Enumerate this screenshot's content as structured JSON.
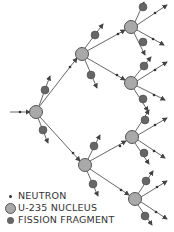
{
  "legend": {
    "neutron": "NEUTRON",
    "nucleus": "U-235 NUCLEUS",
    "fragment": "FISSION FRAGMENT"
  },
  "colors": {
    "nucleus_fill": "#a9a9a9",
    "nucleus_stroke": "#555555",
    "fragment_fill": "#666666",
    "line": "#555555",
    "text": "#333333"
  },
  "nuclei": [
    {
      "id": "gen1",
      "x": 36,
      "y": 112
    },
    {
      "id": "gen2-upper",
      "x": 82,
      "y": 54
    },
    {
      "id": "gen2-lower",
      "x": 85,
      "y": 165
    },
    {
      "id": "gen3-a",
      "x": 131,
      "y": 27
    },
    {
      "id": "gen3-b",
      "x": 131,
      "y": 83
    },
    {
      "id": "gen3-c",
      "x": 132,
      "y": 137
    },
    {
      "id": "gen3-d",
      "x": 135,
      "y": 199
    }
  ]
}
